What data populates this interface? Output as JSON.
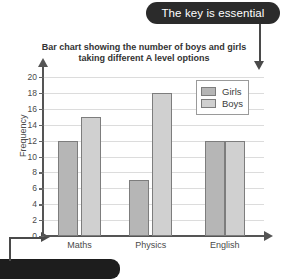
{
  "annotations": {
    "top_callout": "The key is essential",
    "bottom_callout": "",
    "top_arrow_icon": "down-arrow-icon",
    "bottom_arrow_icon": "right-arrow-icon"
  },
  "chart_data": {
    "type": "bar",
    "title": "Bar chart showing the number of boys and girls taking different A level options",
    "categories": [
      "Maths",
      "Physics",
      "English"
    ],
    "series": [
      {
        "name": "Girls",
        "values": [
          12,
          7,
          12
        ],
        "color": "#b6b6b6"
      },
      {
        "name": "Boys",
        "values": [
          15,
          18,
          12
        ],
        "color": "#d0d0d0"
      }
    ],
    "xlabel": "",
    "ylabel": "Frequency",
    "ylim": [
      0,
      20
    ],
    "ytick_step": 2,
    "yticks": [
      0,
      2,
      4,
      6,
      8,
      10,
      12,
      14,
      16,
      18,
      20
    ],
    "grid": true,
    "legend_position": "top-right",
    "legend_entries": [
      "Girls",
      "Boys"
    ]
  }
}
